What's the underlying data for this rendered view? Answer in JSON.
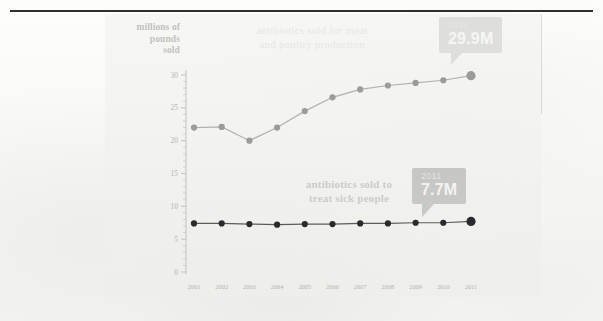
{
  "figure": {
    "y_axis_title": [
      "millions of",
      "pounds",
      "sold"
    ],
    "series_label_livestock": [
      "antibiotics sold for meat",
      "and poultry production"
    ],
    "series_label_human": [
      "antibiotics sold to",
      "treat sick people"
    ],
    "callout_livestock": {
      "year": "2011",
      "value": "29.9M"
    },
    "callout_human": {
      "year": "2011",
      "value": "7.7M"
    },
    "colors": {
      "livestock": "#9b9b9b",
      "human": "#2a2a2e",
      "panel": "#f0f0ed",
      "rule": "#2f2f2f",
      "axis": "#c9c9c6",
      "tick_text": "#b4b4b2"
    }
  },
  "chart_data": {
    "type": "line",
    "title": "",
    "xlabel": "",
    "ylabel": "millions of pounds sold",
    "x": [
      "2001",
      "2002",
      "2003",
      "2004",
      "2005",
      "2006",
      "2007",
      "2008",
      "2009",
      "2010",
      "2011"
    ],
    "categories": [
      "2001",
      "2002",
      "2003",
      "2004",
      "2005",
      "2006",
      "2007",
      "2008",
      "2009",
      "2010",
      "2011"
    ],
    "ylim": [
      0,
      32
    ],
    "yticks": [
      0,
      5,
      10,
      15,
      20,
      25,
      30
    ],
    "ytick_labels": [
      "0",
      "5",
      "10",
      "15",
      "20",
      "25",
      "30"
    ],
    "grid": false,
    "legend": "inline-annotations",
    "minor_ticks": true,
    "series": [
      {
        "name": "antibiotics sold for meat and poultry production",
        "color": "#9b9b9b",
        "values": [
          22.0,
          22.1,
          20.0,
          22.0,
          24.5,
          26.6,
          27.8,
          28.4,
          28.8,
          29.2,
          29.9
        ],
        "highlight_last": true
      },
      {
        "name": "antibiotics sold to treat sick people",
        "color": "#2a2a2e",
        "values": [
          7.4,
          7.4,
          7.3,
          7.2,
          7.3,
          7.3,
          7.4,
          7.4,
          7.5,
          7.5,
          7.7
        ],
        "highlight_last": true
      }
    ],
    "annotations": [
      {
        "series": "antibiotics sold for meat and poultry production",
        "x": "2011",
        "year": "2011",
        "value": "29.9M"
      },
      {
        "series": "antibiotics sold to treat sick people",
        "x": "2011",
        "year": "2011",
        "value": "7.7M"
      }
    ]
  }
}
